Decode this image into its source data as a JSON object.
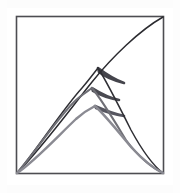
{
  "figure": {
    "background_color": "#ffffff",
    "page_color": "#fdfdfd"
  },
  "frame": {
    "name": "square-border",
    "stroke_color": "#4d4d52",
    "stroke_width": 1.6,
    "left": 16.5,
    "top": 16.5,
    "right": 163.5,
    "bottom": 173.5,
    "fill": "none"
  },
  "anchors": {
    "bottom_left": {
      "x": 17,
      "y": 173
    },
    "bottom_right": {
      "x": 163,
      "y": 173
    },
    "top_right": {
      "x": 163,
      "y": 17
    }
  },
  "chart_data": {
    "type": "line",
    "xlabel": "",
    "ylabel": "",
    "xlim": [
      16.5,
      163.5
    ],
    "ylim": [
      16.5,
      173.5
    ],
    "grid": false,
    "legend": "none",
    "series": [
      {
        "name": "outer-smooth-arc",
        "stroke_color": "#2b2b30",
        "stroke_width": 1.5,
        "has_cusp": false,
        "path": "M 17 173 C 40 150 68 112 92 82 C 112 57 140 30 163 17",
        "points": [
          {
            "x": 17,
            "y": 173
          },
          {
            "x": 48,
            "y": 140
          },
          {
            "x": 74,
            "y": 108
          },
          {
            "x": 96,
            "y": 78
          },
          {
            "x": 124,
            "y": 50
          },
          {
            "x": 163,
            "y": 17
          }
        ]
      },
      {
        "name": "cusped-arc-1",
        "stroke_color": "#2f2f34",
        "stroke_width": 1.5,
        "has_cusp": true,
        "apex": {
          "x": 98,
          "y": 68
        },
        "wedge_color": "#45454c",
        "ascend_path": "M 17 173 C 36 151 62 110 82 88 C 89 80 94 73 98 68",
        "descend_path": "M 98 68 C 107 82 120 108 131 130 C 143 152 155 167 163 173",
        "wedge_path": "M 98 68 C 106 74 116 80 124 83 C 112 80 104 76 99 72 Z",
        "points": [
          {
            "x": 17,
            "y": 173
          },
          {
            "x": 50,
            "y": 130
          },
          {
            "x": 76,
            "y": 94
          },
          {
            "x": 98,
            "y": 68
          },
          {
            "x": 124,
            "y": 114
          },
          {
            "x": 146,
            "y": 152
          },
          {
            "x": 163,
            "y": 173
          }
        ]
      },
      {
        "name": "cusped-arc-2",
        "stroke_color": "#6f6f76",
        "stroke_width": 2.0,
        "has_cusp": true,
        "apex": {
          "x": 92,
          "y": 88
        },
        "wedge_color": "#4a4a51",
        "ascend_path": "M 17 173 C 34 154 56 120 74 102 C 81 95 88 91 92 88",
        "descend_path": "M 92 88 C 102 100 115 122 126 140 C 139 158 154 169 163 173",
        "wedge_path": "M 92 88 C 100 93 110 98 119 100 C 107 98 98 94 93 91 Z",
        "points": [
          {
            "x": 17,
            "y": 173
          },
          {
            "x": 46,
            "y": 140
          },
          {
            "x": 70,
            "y": 108
          },
          {
            "x": 92,
            "y": 88
          },
          {
            "x": 119,
            "y": 126
          },
          {
            "x": 144,
            "y": 158
          },
          {
            "x": 163,
            "y": 173
          }
        ]
      },
      {
        "name": "cusped-arc-3",
        "stroke_color": "#8a8a92",
        "stroke_width": 2.4,
        "has_cusp": true,
        "apex": {
          "x": 95,
          "y": 106
        },
        "wedge_color": "#565660",
        "ascend_path": "M 17 173 C 34 162 58 136 76 119 C 85 111 91 108 95 106",
        "descend_path": "M 95 106 C 106 116 120 134 132 148 C 145 162 157 170 163 173",
        "wedge_path": "M 95 106 C 104 110 115 114 124 116 C 111 114 101 110 96 108 Z",
        "points": [
          {
            "x": 17,
            "y": 173
          },
          {
            "x": 44,
            "y": 152
          },
          {
            "x": 70,
            "y": 126
          },
          {
            "x": 95,
            "y": 106
          },
          {
            "x": 124,
            "y": 140
          },
          {
            "x": 146,
            "y": 162
          },
          {
            "x": 163,
            "y": 173
          }
        ]
      }
    ]
  }
}
